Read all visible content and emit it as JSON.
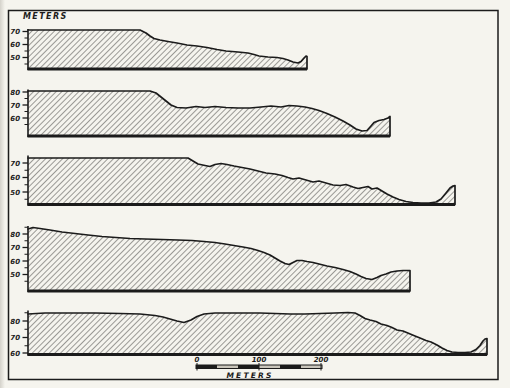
{
  "page": {
    "background": "#e9e7e0",
    "paper": "#f5f4ee",
    "ink": "#1b1b1b",
    "hatch_line": "#2a2a28",
    "scale_bar_light": "#c9c5bb"
  },
  "header": {
    "units_label": "METERS"
  },
  "scale_bar": {
    "x_start": 196,
    "x_end": 322,
    "y": 365,
    "bar_height": 3.5,
    "segments": 6,
    "tick_labels": [
      {
        "text": "0",
        "x": 197
      },
      {
        "text": "100",
        "x": 259
      },
      {
        "text": "200",
        "x": 321
      }
    ],
    "units_label": "METERS",
    "px_per_100m": 63
  },
  "chart_data": {
    "type": "area",
    "title": "METERS",
    "y_axis_unit": "meters",
    "x_scale_px_per_100m": 63,
    "legend": "none",
    "profiles": [
      {
        "id": "profile-1",
        "left_x": 28,
        "right_x": 307,
        "axis_top_y": 29,
        "base_y": 69,
        "y_ticks": [
          {
            "label": "70",
            "y": 31.5
          },
          {
            "label": "60",
            "y": 44.5
          },
          {
            "label": "50",
            "y": 57.5
          }
        ],
        "surface": [
          [
            28,
            30
          ],
          [
            140,
            30
          ],
          [
            146,
            33
          ],
          [
            150,
            36
          ],
          [
            154,
            38.5
          ],
          [
            160,
            40
          ],
          [
            168,
            41.5
          ],
          [
            177,
            43
          ],
          [
            187,
            45
          ],
          [
            197,
            46
          ],
          [
            207,
            47.5
          ],
          [
            217,
            49.5
          ],
          [
            226,
            51
          ],
          [
            238,
            52
          ],
          [
            248,
            53
          ],
          [
            254,
            54.5
          ],
          [
            259,
            56
          ],
          [
            268,
            57
          ],
          [
            277,
            57.5
          ],
          [
            283,
            58.5
          ],
          [
            288,
            60
          ],
          [
            293,
            62
          ],
          [
            298,
            63
          ],
          [
            301,
            61.5
          ],
          [
            304,
            58
          ],
          [
            306,
            56
          ],
          [
            307,
            56.5
          ]
        ]
      },
      {
        "id": "profile-2",
        "left_x": 28,
        "right_x": 390,
        "axis_top_y": 89.5,
        "base_y": 136,
        "y_ticks": [
          {
            "label": "80",
            "y": 92
          },
          {
            "label": "70",
            "y": 105
          },
          {
            "label": "60",
            "y": 118
          }
        ],
        "surface": [
          [
            28,
            91
          ],
          [
            150,
            91
          ],
          [
            156,
            93
          ],
          [
            161,
            97
          ],
          [
            166,
            101
          ],
          [
            171,
            105
          ],
          [
            177,
            107.5
          ],
          [
            186,
            108
          ],
          [
            196,
            106.5
          ],
          [
            205,
            107.5
          ],
          [
            215,
            106.5
          ],
          [
            226,
            107.5
          ],
          [
            238,
            108
          ],
          [
            250,
            108
          ],
          [
            261,
            107
          ],
          [
            271,
            106
          ],
          [
            281,
            107
          ],
          [
            289,
            105.5
          ],
          [
            297,
            106
          ],
          [
            305,
            107
          ],
          [
            312,
            108.5
          ],
          [
            319,
            110.5
          ],
          [
            327,
            113.5
          ],
          [
            335,
            117
          ],
          [
            343,
            121
          ],
          [
            350,
            125
          ],
          [
            356,
            129
          ],
          [
            362,
            131
          ],
          [
            367,
            130.5
          ],
          [
            371,
            126
          ],
          [
            374,
            122.5
          ],
          [
            379,
            120.5
          ],
          [
            384,
            119.5
          ],
          [
            388,
            118
          ],
          [
            390,
            116.5
          ]
        ]
      },
      {
        "id": "profile-3",
        "left_x": 28,
        "right_x": 455,
        "axis_top_y": 155.5,
        "base_y": 204.5,
        "y_ticks": [
          {
            "label": "70",
            "y": 163
          },
          {
            "label": "60",
            "y": 177.5
          },
          {
            "label": "50",
            "y": 192
          }
        ],
        "surface": [
          [
            28,
            158
          ],
          [
            188,
            158
          ],
          [
            193,
            161
          ],
          [
            198,
            164
          ],
          [
            205,
            165.5
          ],
          [
            210,
            166.5
          ],
          [
            215,
            164.5
          ],
          [
            221,
            163.5
          ],
          [
            227,
            164.5
          ],
          [
            234,
            166
          ],
          [
            242,
            167.5
          ],
          [
            250,
            169
          ],
          [
            258,
            171
          ],
          [
            266,
            173
          ],
          [
            275,
            174
          ],
          [
            282,
            175.5
          ],
          [
            288,
            177.5
          ],
          [
            293,
            179
          ],
          [
            299,
            178
          ],
          [
            306,
            180
          ],
          [
            313,
            182
          ],
          [
            319,
            181
          ],
          [
            326,
            183
          ],
          [
            333,
            185
          ],
          [
            340,
            185.5
          ],
          [
            346,
            184.5
          ],
          [
            353,
            187
          ],
          [
            358,
            188.5
          ],
          [
            363,
            187.5
          ],
          [
            368,
            186.5
          ],
          [
            372,
            189
          ],
          [
            377,
            188
          ],
          [
            382,
            191
          ],
          [
            387,
            194
          ],
          [
            393,
            197
          ],
          [
            399,
            199.5
          ],
          [
            406,
            201.5
          ],
          [
            413,
            202.5
          ],
          [
            421,
            203
          ],
          [
            429,
            203
          ],
          [
            436,
            202
          ],
          [
            441,
            199
          ],
          [
            446,
            193
          ],
          [
            450,
            188
          ],
          [
            453,
            186
          ],
          [
            455,
            185.5
          ]
        ]
      },
      {
        "id": "profile-4",
        "left_x": 28,
        "right_x": 410,
        "axis_top_y": 226,
        "base_y": 291,
        "y_ticks": [
          {
            "label": "80",
            "y": 234
          },
          {
            "label": "70",
            "y": 247.5
          },
          {
            "label": "60",
            "y": 261
          },
          {
            "label": "50",
            "y": 274.5
          }
        ],
        "surface": [
          [
            28,
            229
          ],
          [
            33,
            227.5
          ],
          [
            40,
            228.5
          ],
          [
            50,
            230
          ],
          [
            62,
            232
          ],
          [
            75,
            233.5
          ],
          [
            88,
            235
          ],
          [
            102,
            236.5
          ],
          [
            116,
            237.5
          ],
          [
            130,
            238.5
          ],
          [
            145,
            239
          ],
          [
            162,
            239.5
          ],
          [
            178,
            240
          ],
          [
            192,
            240.5
          ],
          [
            204,
            241.5
          ],
          [
            215,
            242.5
          ],
          [
            225,
            244
          ],
          [
            234,
            245.5
          ],
          [
            243,
            247
          ],
          [
            251,
            248.5
          ],
          [
            258,
            250.5
          ],
          [
            264,
            252.5
          ],
          [
            270,
            255
          ],
          [
            275,
            258
          ],
          [
            280,
            261
          ],
          [
            285,
            263.5
          ],
          [
            289,
            264.5
          ],
          [
            293,
            262.5
          ],
          [
            297,
            260.5
          ],
          [
            302,
            260.5
          ],
          [
            307,
            261.5
          ],
          [
            313,
            262.5
          ],
          [
            319,
            264
          ],
          [
            327,
            266
          ],
          [
            335,
            267.5
          ],
          [
            343,
            269.5
          ],
          [
            350,
            271.5
          ],
          [
            356,
            274
          ],
          [
            361,
            276.5
          ],
          [
            366,
            278.5
          ],
          [
            372,
            279.5
          ],
          [
            377,
            277.5
          ],
          [
            381,
            275.5
          ],
          [
            386,
            274
          ],
          [
            391,
            272
          ],
          [
            397,
            271
          ],
          [
            403,
            270.5
          ],
          [
            410,
            270.5
          ]
        ]
      },
      {
        "id": "profile-5",
        "left_x": 28,
        "right_x": 487,
        "axis_top_y": 310.5,
        "base_y": 354.5,
        "y_ticks": [
          {
            "label": "80",
            "y": 321
          },
          {
            "label": "70",
            "y": 337.5
          },
          {
            "label": "60",
            "y": 353
          }
        ],
        "surface": [
          [
            28,
            314
          ],
          [
            45,
            313
          ],
          [
            70,
            313
          ],
          [
            95,
            313
          ],
          [
            120,
            313.5
          ],
          [
            140,
            314
          ],
          [
            155,
            315.5
          ],
          [
            163,
            317
          ],
          [
            170,
            319
          ],
          [
            177,
            321
          ],
          [
            184,
            322.5
          ],
          [
            191,
            320
          ],
          [
            197,
            316.5
          ],
          [
            204,
            314
          ],
          [
            215,
            313
          ],
          [
            230,
            313
          ],
          [
            245,
            313
          ],
          [
            260,
            313
          ],
          [
            275,
            313.5
          ],
          [
            290,
            314
          ],
          [
            305,
            314
          ],
          [
            320,
            313.5
          ],
          [
            335,
            313
          ],
          [
            348,
            312.5
          ],
          [
            355,
            313
          ],
          [
            360,
            315.5
          ],
          [
            365,
            318.5
          ],
          [
            370,
            320
          ],
          [
            376,
            321.5
          ],
          [
            381,
            324
          ],
          [
            387,
            325.5
          ],
          [
            392,
            327.5
          ],
          [
            397,
            330
          ],
          [
            403,
            331
          ],
          [
            409,
            333.5
          ],
          [
            415,
            336
          ],
          [
            420,
            338
          ],
          [
            426,
            340.5
          ],
          [
            431,
            342
          ],
          [
            437,
            345
          ],
          [
            442,
            348
          ],
          [
            447,
            350.5
          ],
          [
            452,
            352
          ],
          [
            458,
            352.5
          ],
          [
            465,
            352.5
          ],
          [
            471,
            352
          ],
          [
            476,
            349.5
          ],
          [
            480,
            345.5
          ],
          [
            483,
            341
          ],
          [
            485,
            339
          ],
          [
            487,
            338.5
          ]
        ]
      }
    ]
  }
}
